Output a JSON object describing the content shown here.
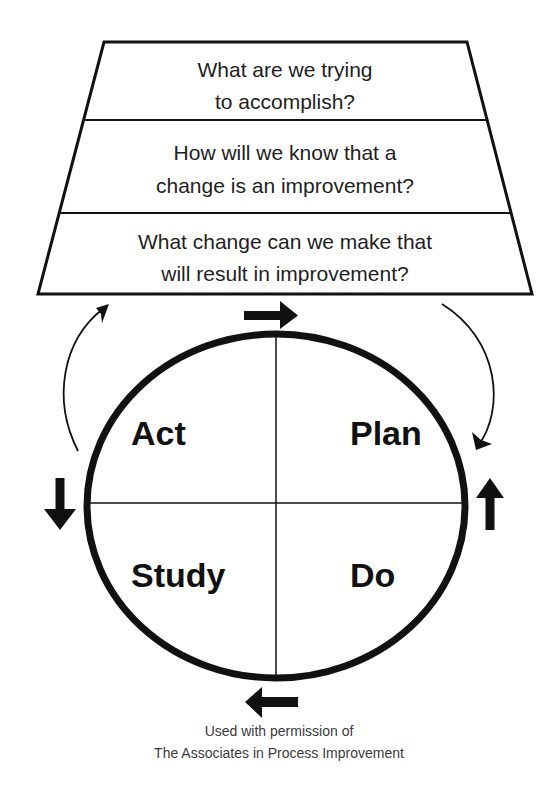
{
  "model": {
    "questions": [
      {
        "lines": [
          "What are we trying",
          "to accomplish?"
        ]
      },
      {
        "lines": [
          "How will we know that a",
          "change is an improvement?"
        ]
      },
      {
        "lines": [
          "What change can we make that",
          "will result in improvement?"
        ]
      }
    ],
    "cycle": {
      "quadrants": {
        "top_left": "Act",
        "top_right": "Plan",
        "bottom_left": "Study",
        "bottom_right": "Do"
      }
    },
    "arrows": {
      "top": "right-arrow",
      "right": "up-arrow",
      "bottom": "left-arrow",
      "left": "down-arrow",
      "feedback_right": "curved-arrow-down",
      "feedback_left": "curved-arrow-up"
    }
  },
  "footnote": {
    "line1": "Used with permission of",
    "line2": "The Associates in Process Improvement"
  },
  "colors": {
    "ink": "#111111",
    "text": "#1e1e1e",
    "footnote": "#3a3a3a",
    "background": "#ffffff"
  }
}
